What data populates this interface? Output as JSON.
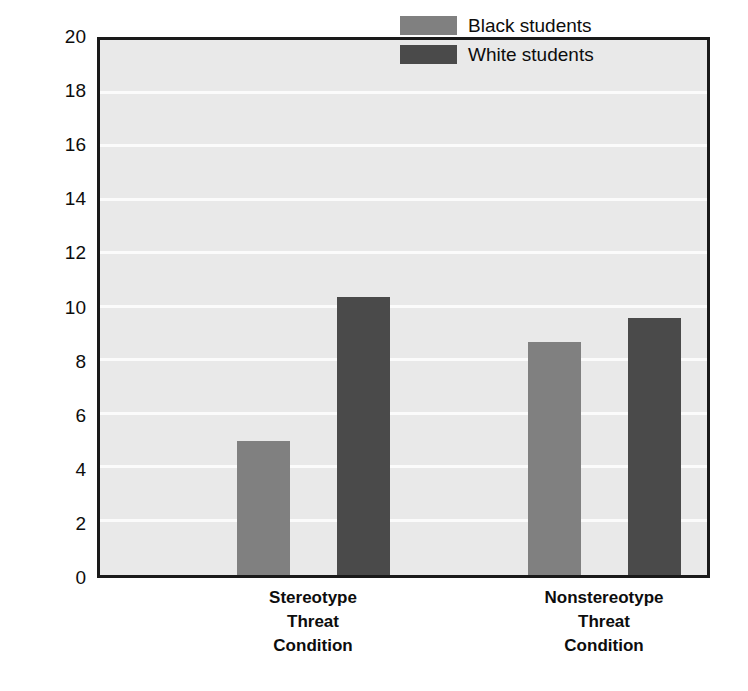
{
  "chart_data": {
    "type": "bar",
    "title": "",
    "xlabel": "",
    "ylabel": "Number of Items Solved",
    "ylim": [
      0,
      20
    ],
    "ytick_step": 2,
    "yticks": [
      0,
      2,
      4,
      6,
      8,
      10,
      12,
      14,
      16,
      18,
      20
    ],
    "ytick_labels": [
      "0",
      "2",
      "4",
      "6",
      "8",
      "10",
      "12",
      "14",
      "16",
      "18",
      "20"
    ],
    "grid": true,
    "grid_axis": "y",
    "grid_color": "#fbfbfb",
    "plot_background": "#e9e9e9",
    "legend_position": "top-right",
    "categories": [
      "Stereotype Threat Condition",
      "Nonstereotype Threat Condition"
    ],
    "category_lines": [
      [
        "Stereotype",
        "Threat",
        "Condition"
      ],
      [
        "Nonstereotype",
        "Threat",
        "Condition"
      ]
    ],
    "series": [
      {
        "name": "Black students",
        "color": "#808080",
        "values": [
          5.0,
          8.7
        ]
      },
      {
        "name": "White students",
        "color": "#4a4a4a",
        "values": [
          10.4,
          9.6
        ]
      }
    ]
  },
  "legend": {
    "items": [
      {
        "label": "Black students",
        "color": "#808080"
      },
      {
        "label": "White students",
        "color": "#4a4a4a"
      }
    ]
  },
  "axis": {
    "y_title": "Number of Items Solved"
  }
}
